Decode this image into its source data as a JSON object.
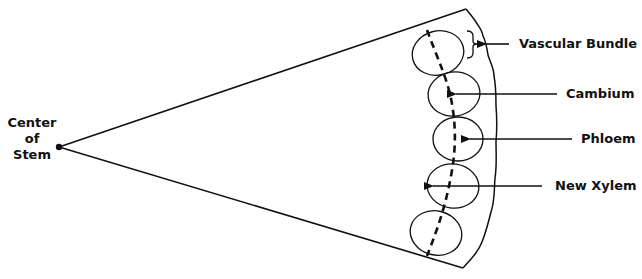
{
  "diagram": {
    "type": "labeled-illustration",
    "labels": {
      "center": [
        "Center",
        "of",
        "Stem"
      ],
      "vascular_bundle": "Vascular Bundle",
      "cambium": "Cambium",
      "phloem": "Phloem",
      "new_xylem": "New Xylem"
    },
    "stroke_color": "#111111",
    "background_color": "#ffffff",
    "vascular_bundle_count": 5
  }
}
